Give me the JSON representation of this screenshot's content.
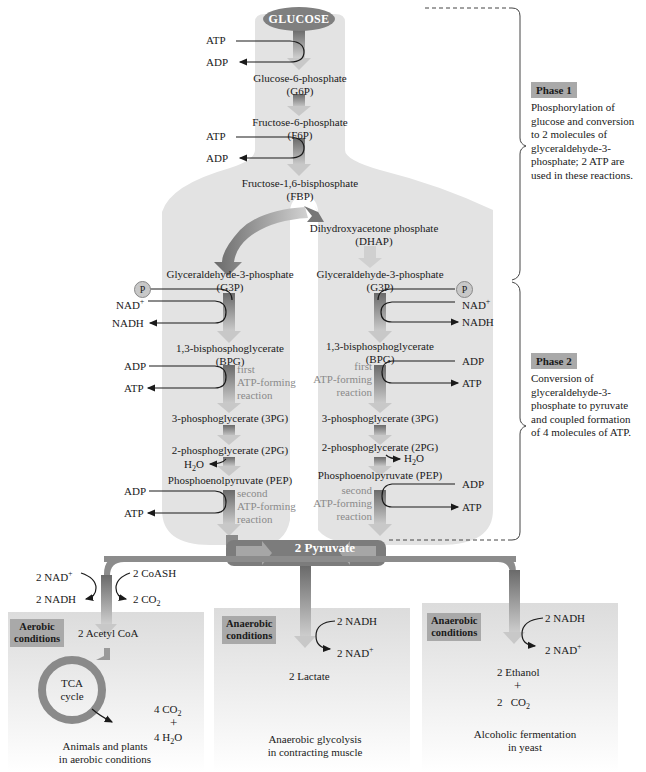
{
  "start": {
    "label": "GLUCOSE"
  },
  "phase1": {
    "tag": "Phase 1",
    "description": [
      "Phosphorylation of",
      "glucose and conversion",
      "to 2 molecules of",
      "glyceraldehyde-3-",
      "phosphate; 2 ATP are",
      "used in these reactions."
    ]
  },
  "phase2": {
    "tag": "Phase 2",
    "description": [
      "Conversion of",
      "glyceraldehyde-3-",
      "phosphate to pyruvate",
      "and coupled formation",
      "of 4 molecules of ATP."
    ]
  },
  "trunk": {
    "g6p": {
      "name": "Glucose-6-phosphate",
      "abbr": "(G6P)"
    },
    "f6p": {
      "name": "Fructose-6-phosphate",
      "abbr": "(F6P)"
    },
    "fbp": {
      "name": "Fructose-1,6-bisphosphate",
      "abbr": "(FBP)"
    },
    "step1": {
      "in": "ATP",
      "out": "ADP"
    },
    "step3": {
      "in": "ATP",
      "out": "ADP"
    }
  },
  "dhap": {
    "name": "Dihydroxyacetone phosphate",
    "abbr": "(DHAP)"
  },
  "left_branch": {
    "g3p": {
      "name": "Glyceraldehyde-3-phosphate",
      "abbr": "(G3P)"
    },
    "phosphate_badge": "P",
    "nad_in": "NAD",
    "nad_sup": "+",
    "nadh_out": "NADH",
    "bpg": {
      "name": "1,3-bisphosphoglycerate",
      "abbr": "(BPG)"
    },
    "adp1": "ADP",
    "atp1": "ATP",
    "note1": [
      "first",
      "ATP-forming",
      "reaction"
    ],
    "pg3": "3-phosphoglycerate (3PG)",
    "pg2": "2-phosphoglycerate (2PG)",
    "water": "H",
    "water_sub": "2",
    "water_o": "O",
    "pep": "Phosphoenolpyruvate (PEP)",
    "adp2": "ADP",
    "atp2": "ATP",
    "note2": [
      "second",
      "ATP-forming",
      "reaction"
    ]
  },
  "right_branch": {
    "g3p": {
      "name": "Glyceraldehyde-3-phosphate",
      "abbr": "(G3P)"
    },
    "phosphate_badge": "P",
    "nad_in": "NAD",
    "nad_sup": "+",
    "nadh_out": "NADH",
    "bpg": {
      "name": "1,3-bisphosphoglycerate",
      "abbr": "(BPG)"
    },
    "adp1": "ADP",
    "atp1": "ATP",
    "note1": [
      "first",
      "ATP-forming",
      "reaction"
    ],
    "pg3": "3-phosphoglycerate (3PG)",
    "pg2": "2-phosphoglycerate (2PG)",
    "water": "H",
    "water_sub": "2",
    "water_o": "O",
    "pep": "Phosphoenolpyruvate (PEP)",
    "adp2": "ADP",
    "atp2": "ATP",
    "note2": [
      "second",
      "ATP-forming",
      "reaction"
    ]
  },
  "pyruvate": {
    "label": "2 Pyruvate"
  },
  "aerobic": {
    "tag": [
      "Aerobic",
      "conditions"
    ],
    "nad_in": "2 NAD",
    "nad_sup": "+",
    "nadh_out": "2 NADH",
    "coash_in": "2 CoASH",
    "co2_out": "2 CO",
    "co2_sub": "2",
    "product": "2 Acetyl CoA",
    "cycle": [
      "TCA",
      "cycle"
    ],
    "out_co2": "4 CO",
    "out_co2_sub": "2",
    "plus": "+",
    "out_h2o": "4 H",
    "out_h2o_sub": "2",
    "out_h2o_o": "O",
    "caption": [
      "Animals and plants",
      "in aerobic conditions"
    ]
  },
  "lactate": {
    "tag": [
      "Anaerobic",
      "conditions"
    ],
    "nadh_in": "2 NADH",
    "nad_out": "2 NAD",
    "nad_sup": "+",
    "product": "2 Lactate",
    "caption": [
      "Anaerobic glycolysis",
      "in contracting muscle"
    ]
  },
  "ethanol": {
    "tag": [
      "Anaerobic",
      "conditions"
    ],
    "nadh_in": "2 NADH",
    "nad_out": "2 NAD",
    "nad_sup": "+",
    "product": "2 Ethanol",
    "plus": "+",
    "co2": "2   CO",
    "co2_sub": "2",
    "caption": [
      "Alcoholic fermentation",
      "in yeast"
    ]
  },
  "colors": {
    "shade": "#e4e4e4",
    "arrow_dark": "#6e6e6e",
    "arrow_light": "#c4c4c4",
    "tag_bg": "#a9a9a9",
    "note_text": "#8a8a8a"
  }
}
